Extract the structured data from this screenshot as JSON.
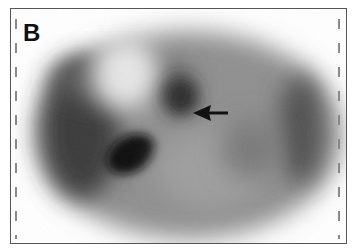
{
  "figure": {
    "panel_label": "B",
    "image_type": "grayscale axial tomographic scan slice",
    "annotation": {
      "type": "arrow",
      "direction": "left",
      "color": "#111111"
    }
  }
}
